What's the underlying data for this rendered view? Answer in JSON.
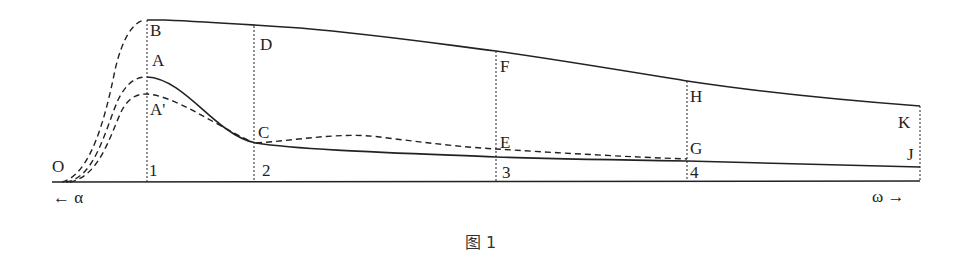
{
  "figure": {
    "caption": "图 1",
    "axis": {
      "left_label": "← α",
      "right_label": "ω →",
      "origin_label": "O"
    },
    "points": {
      "B": "B",
      "A": "A",
      "A_prime": "A'",
      "C": "C",
      "D": "D",
      "E": "E",
      "F": "F",
      "G": "G",
      "H": "H",
      "J": "J",
      "K": "K"
    },
    "stations": [
      "1",
      "2",
      "3",
      "4"
    ]
  },
  "colors": {
    "line": "#222222",
    "background": "#ffffff"
  }
}
